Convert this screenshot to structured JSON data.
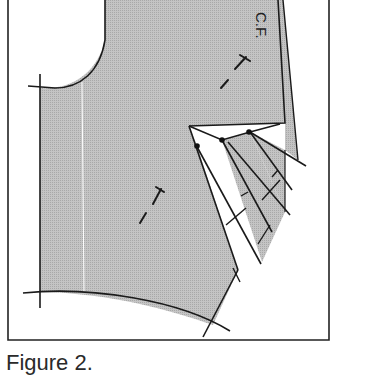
{
  "figure": {
    "caption": "Figure 2.",
    "labels": {
      "center_front": "C.F."
    },
    "colors": {
      "fill": "#bdbdbd",
      "line": "#1a1a1a",
      "background": "#ffffff"
    }
  }
}
